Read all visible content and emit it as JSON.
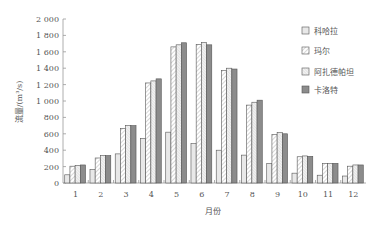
{
  "chart_data": {
    "type": "bar",
    "title": "",
    "xlabel": "月份",
    "ylabel": "流量/(m³/s)",
    "ylim": [
      0,
      2000
    ],
    "yticks": [
      "0",
      "200",
      "400",
      "600",
      "800",
      "1 000",
      "1 200",
      "1 400",
      "1 600",
      "1 800",
      "2 000"
    ],
    "grid": false,
    "legend_position": "right",
    "categories": [
      "1",
      "2",
      "3",
      "4",
      "5",
      "6",
      "7",
      "8",
      "9",
      "10",
      "11",
      "12"
    ],
    "series": [
      {
        "name": "科哈拉",
        "pattern": "light-gray",
        "values": [
          100,
          165,
          355,
          545,
          620,
          480,
          400,
          340,
          240,
          120,
          95,
          85
        ]
      },
      {
        "name": "玛尔",
        "pattern": "diagonal-hatch",
        "values": [
          205,
          305,
          665,
          1220,
          1660,
          1690,
          1370,
          950,
          590,
          320,
          240,
          205
        ]
      },
      {
        "name": "阿扎德帕坦",
        "pattern": "dense-hatch",
        "values": [
          215,
          335,
          700,
          1245,
          1685,
          1715,
          1400,
          985,
          615,
          330,
          240,
          220
        ]
      },
      {
        "name": "卡洛特",
        "pattern": "dark-gray",
        "values": [
          220,
          335,
          700,
          1270,
          1710,
          1685,
          1390,
          1010,
          600,
          325,
          240,
          220
        ]
      }
    ]
  },
  "colors": {
    "axis": "#999999",
    "series_fill": [
      "#e8e8e8",
      "#ffffff",
      "#ffffff",
      "#8a8a8a"
    ],
    "bar_stroke": "#555555"
  }
}
